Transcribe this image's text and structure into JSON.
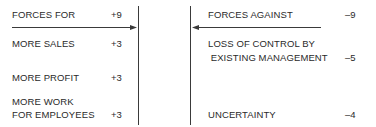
{
  "diagram": {
    "type": "force-field-analysis",
    "forces_for": {
      "header": {
        "label": "FORCES FOR",
        "value": "+9"
      },
      "items": [
        {
          "label_lines": [
            "MORE SALES"
          ],
          "value": "+3"
        },
        {
          "label_lines": [
            "MORE PROFIT"
          ],
          "value": "+3"
        },
        {
          "label_lines": [
            "MORE WORK",
            "FOR EMPLOYEES"
          ],
          "value": "+3"
        }
      ]
    },
    "forces_against": {
      "header": {
        "label": "FORCES AGAINST",
        "value": "–9"
      },
      "items": [
        {
          "label_lines": [
            "LOSS OF CONTROL BY",
            " EXISTING MANAGEMENT"
          ],
          "value": "–5"
        },
        {
          "label_lines": [
            "UNCERTAINTY"
          ],
          "value": "–4"
        }
      ]
    },
    "colors": {
      "text": "#2a2a2a",
      "lines": "#3a3a3a"
    }
  }
}
